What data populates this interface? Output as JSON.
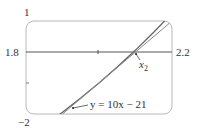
{
  "chart_data": {
    "type": "line",
    "title": "",
    "xlabel": "",
    "ylabel": "",
    "xlim": [
      1.8,
      2.2
    ],
    "ylim": [
      -2,
      1
    ],
    "grid": false,
    "x_tick_labels": [
      "1.8",
      "2.2"
    ],
    "y_tick_labels": [
      "1",
      "-2"
    ],
    "x_ticks": [
      2.0
    ],
    "y_ticks": [
      -1
    ],
    "series": [
      {
        "name": "y = x^3 - 2x - 5",
        "x": [
          1.8,
          1.85,
          1.9,
          1.95,
          2.0,
          2.05,
          2.1,
          2.15,
          2.2
        ],
        "y": [
          -2.768,
          -2.368,
          -1.941,
          -1.486,
          -1.0,
          -0.485,
          0.061,
          0.638,
          1.248
        ]
      },
      {
        "name": "y = 10x - 21",
        "x": [
          1.9,
          2.0,
          2.1,
          2.2
        ],
        "y": [
          -2,
          -1,
          0,
          1
        ]
      }
    ],
    "annotations": [
      {
        "text": "y = 10x − 21",
        "points_to": "tangent line"
      },
      {
        "text": "x₂",
        "points_to": "x-intercept of tangent line at x = 2.1"
      }
    ]
  },
  "labels": {
    "ymax": "1",
    "ymin": "−2",
    "xmin": "1.8",
    "xmax": "2.2",
    "tangent_label": "y = 10x − 21",
    "x2_base": "x",
    "x2_sub": "2"
  }
}
